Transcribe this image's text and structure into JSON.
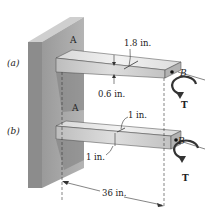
{
  "figure": {
    "cases": [
      {
        "case_label": "(a)",
        "end_a": "A",
        "end_b": "B",
        "torque": "T",
        "cross_section": "rectangular",
        "dim_width": "1.8 in.",
        "dim_thickness": "0.6 in."
      },
      {
        "case_label": "(b)",
        "end_a": "A",
        "end_b": "B",
        "torque": "T",
        "cross_section": "square",
        "dim_width": "1 in.",
        "dim_thickness": "1 in."
      }
    ],
    "length": "36 in.",
    "colors": {
      "wall_front": "#a8a8a8",
      "wall_side": "#8a8a8a",
      "wall_top": "#d0d0d0",
      "beam_top": "#e4e4e4",
      "beam_front": "#c9c9c9",
      "beam_end": "#b0b0b0",
      "line": "#333333"
    }
  }
}
